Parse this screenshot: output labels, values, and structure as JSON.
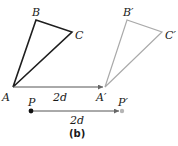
{
  "figure": {
    "caption": "(b)",
    "colors": {
      "original": "#1e1e1e",
      "image": "#aaaaaa",
      "arrow": "#555555",
      "point_start": "#111111",
      "point_end": "#b5b5b5"
    },
    "original_triangle": {
      "vertices": {
        "A": [
          13,
          87
        ],
        "B": [
          36,
          20
        ],
        "C": [
          72,
          32
        ]
      },
      "labels": {
        "A": "A",
        "B": "B",
        "C": "C"
      }
    },
    "translated_triangle": {
      "vertices": {
        "A": [
          105,
          87
        ],
        "B": [
          127,
          20
        ],
        "C": [
          162,
          32
        ]
      },
      "labels": {
        "A": "A′",
        "B": "B′",
        "C": "C′"
      }
    },
    "triangle_vector": {
      "from": [
        13,
        87
      ],
      "to": [
        105,
        87
      ],
      "label": "2d"
    },
    "point_vector": {
      "from": [
        31,
        111
      ],
      "to": [
        122,
        111
      ],
      "label": "2d",
      "start_label": "P",
      "end_label": "P′"
    }
  }
}
